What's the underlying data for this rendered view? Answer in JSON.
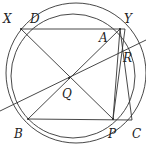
{
  "diagram": {
    "type": "geometry",
    "stroke_color": "#333333",
    "circles": [
      {
        "name": "outer-circle",
        "cx": 76,
        "cy": 73,
        "r": 70
      },
      {
        "name": "inner-circle",
        "cx": 73,
        "cy": 76,
        "r": 62
      }
    ],
    "points": {
      "X": {
        "label": "X",
        "x": 21,
        "y": 29,
        "lx": 3,
        "ly": 23
      },
      "D": {
        "label": "D",
        "x": 36,
        "y": 29,
        "lx": 30,
        "ly": 23
      },
      "Y": {
        "label": "Y",
        "x": 120,
        "y": 29,
        "lx": 124,
        "ly": 23
      },
      "A": {
        "label": "A",
        "x": 113,
        "y": 32,
        "lx": 99,
        "ly": 42
      },
      "R": {
        "label": "R",
        "x": 123,
        "y": 53,
        "lx": 123,
        "ly": 62
      },
      "Q": {
        "label": "Q",
        "x": 69,
        "y": 78,
        "lx": 62,
        "ly": 98
      },
      "B": {
        "label": "B",
        "x": 28,
        "y": 119,
        "lx": 14,
        "ly": 138
      },
      "P": {
        "label": "P",
        "x": 113,
        "y": 119,
        "lx": 108,
        "ly": 138
      },
      "C": {
        "label": "C",
        "x": 132,
        "y": 120,
        "lx": 132,
        "ly": 138
      }
    },
    "segments": [
      [
        "X",
        "Y2"
      ],
      [
        "X",
        "C"
      ],
      [
        "B",
        "Y"
      ],
      [
        "B",
        "C"
      ],
      [
        "P",
        "Y"
      ],
      [
        "P",
        "Y2"
      ],
      [
        "C",
        "Y2"
      ]
    ],
    "line_through_Q": {
      "x1": 0,
      "y1": 111,
      "x2": 146,
      "y2": 40
    }
  }
}
